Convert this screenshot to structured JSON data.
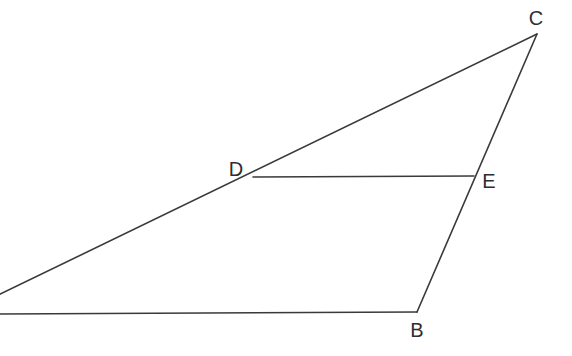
{
  "figure": {
    "type": "geometry-diagram",
    "background_color": "#ffffff",
    "line_color": "#3a3a3c",
    "label_color": "#2e2e30",
    "line_width": 1.6,
    "canvas": {
      "width": 572,
      "height": 356
    }
  },
  "points": [
    {
      "id": "A",
      "label": "",
      "x": -12,
      "y": 300,
      "visible_label": false,
      "on_canvas": false
    },
    {
      "id": "B",
      "label": "B",
      "x": 417,
      "y": 312,
      "label_x": 417,
      "label_y": 337,
      "visible_label": true,
      "on_canvas": true
    },
    {
      "id": "C",
      "label": "C",
      "x": 537,
      "y": 34,
      "label_x": 536,
      "label_y": 25,
      "visible_label": true,
      "on_canvas": true
    },
    {
      "id": "D",
      "label": "D",
      "x": 253,
      "y": 177,
      "label_x": 236,
      "label_y": 176,
      "visible_label": true,
      "on_canvas": true
    },
    {
      "id": "E",
      "label": "E",
      "x": 474,
      "y": 176,
      "label_x": 489,
      "label_y": 188,
      "visible_label": true,
      "on_canvas": true
    }
  ],
  "segments": [
    {
      "id": "AC",
      "from": "A",
      "to": "C",
      "x1": -12,
      "y1": 300,
      "x2": 537,
      "y2": 34
    },
    {
      "id": "AB",
      "from": "A",
      "to": "B",
      "x1": -12,
      "y1": 314,
      "x2": 417,
      "y2": 312
    },
    {
      "id": "BC",
      "from": "B",
      "to": "C",
      "x1": 417,
      "y1": 312,
      "x2": 537,
      "y2": 34
    },
    {
      "id": "DE",
      "from": "D",
      "to": "E",
      "x1": 253,
      "y1": 177,
      "x2": 474,
      "y2": 176
    }
  ],
  "labels": {
    "b": "B",
    "c": "C",
    "d": "D",
    "e": "E"
  }
}
